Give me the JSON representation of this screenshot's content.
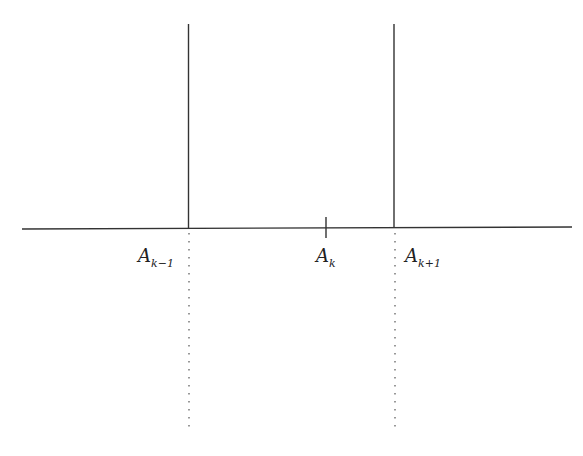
{
  "diagram": {
    "type": "axis-with-partition-points",
    "colors": {
      "line": "#333333",
      "background": "#ffffff"
    },
    "points": [
      {
        "base": "A",
        "subscript": "k−1"
      },
      {
        "base": "A",
        "subscript": "k"
      },
      {
        "base": "A",
        "subscript": "k+1"
      }
    ]
  }
}
